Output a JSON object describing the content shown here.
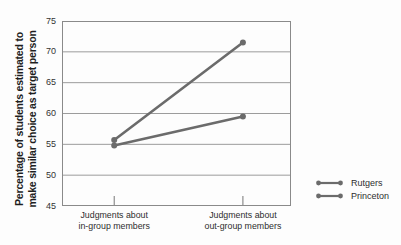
{
  "chart_data": {
    "type": "line",
    "ylabel_lines": [
      "Percentage of students estimated to",
      "make similar choice as target person"
    ],
    "categories": [
      {
        "line1": "Judgments about",
        "line2": "in-group members"
      },
      {
        "line1": "Judgments about",
        "line2": "out-group members"
      }
    ],
    "series": [
      {
        "name": "Rutgers",
        "values": [
          55.7,
          71.5
        ]
      },
      {
        "name": "Princeton",
        "values": [
          54.8,
          59.5
        ]
      }
    ],
    "ylim": [
      45,
      75
    ],
    "yticks": [
      75,
      70,
      65,
      60,
      55,
      50,
      45
    ],
    "grid": "horizontal",
    "legend_position": "right-bottom",
    "x_fractions": [
      0.228,
      0.79
    ]
  },
  "colors": {
    "series_line": "#6b6b6b",
    "grid_line": "#9c9c9c",
    "plot_border": "#8a8a8a",
    "tick_mark": "#777777",
    "text": "#2e2e2e",
    "background": "#fdfdfd"
  }
}
